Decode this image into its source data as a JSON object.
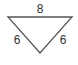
{
  "diagram": {
    "shape": "inverted-triangle",
    "stroke_color": "#555555",
    "sides": {
      "top": "8",
      "left": "6",
      "right": "6"
    }
  }
}
